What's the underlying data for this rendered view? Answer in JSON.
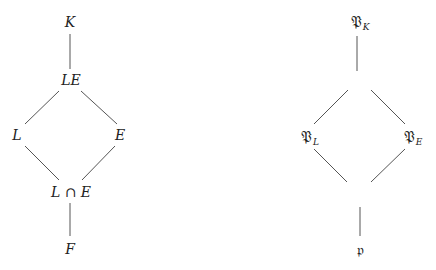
{
  "left_lattice": {
    "nodes": {
      "top": "K",
      "upper": "LE",
      "left": "L",
      "right": "E",
      "lower": "L ∩ E",
      "bottom": "F"
    },
    "edges": [
      [
        "K",
        "LE"
      ],
      [
        "LE",
        "L"
      ],
      [
        "LE",
        "E"
      ],
      [
        "L",
        "L ∩ E"
      ],
      [
        "E",
        "L ∩ E"
      ],
      [
        "L ∩ E",
        "F"
      ]
    ]
  },
  "right_lattice": {
    "nodes": {
      "top": {
        "symbol": "𝔓",
        "subscript": "K"
      },
      "upper": {
        "symbol": "",
        "subscript": ""
      },
      "left": {
        "symbol": "𝔓",
        "subscript": "L"
      },
      "right": {
        "symbol": "𝔓",
        "subscript": "E"
      },
      "lower": {
        "symbol": "",
        "subscript": ""
      },
      "bottom": {
        "symbol": "𝔭",
        "subscript": ""
      }
    },
    "edges": [
      [
        "𝔓_K",
        "(blank)"
      ],
      [
        "(blank)",
        "𝔓_L"
      ],
      [
        "(blank)",
        "𝔓_E"
      ],
      [
        "𝔓_L",
        "(blank)"
      ],
      [
        "𝔓_E",
        "(blank)"
      ],
      [
        "(blank)",
        "𝔭"
      ]
    ]
  },
  "colors": {
    "line": "#555555",
    "text": "#222222",
    "background": "#ffffff"
  }
}
